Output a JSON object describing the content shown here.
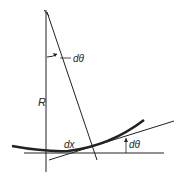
{
  "diagram": {
    "labels": {
      "angle_top": "dθ",
      "radius": "R",
      "arc_length": "dx",
      "angle_right": "dθ"
    },
    "colors": {
      "line": "#222222",
      "background": "#ffffff"
    }
  }
}
